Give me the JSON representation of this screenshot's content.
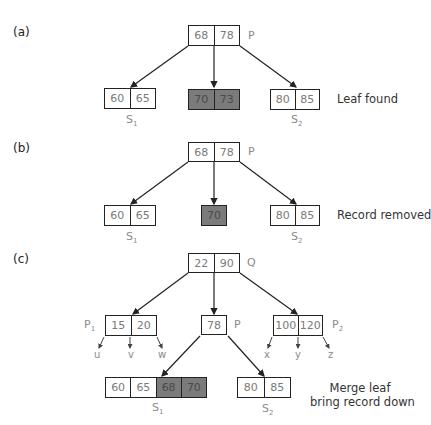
{
  "panels": [
    {
      "label": "(a)",
      "caption": "Leaf found",
      "parent": {
        "keys": [
          "68",
          "78"
        ],
        "name": "P"
      },
      "children": [
        {
          "keys": [
            "60",
            "65"
          ],
          "name": "S",
          "sub": "1",
          "highlight": [
            false,
            false
          ]
        },
        {
          "keys": [
            "70",
            "73"
          ],
          "name": "",
          "sub": "",
          "highlight": [
            true,
            true
          ]
        },
        {
          "keys": [
            "80",
            "85"
          ],
          "name": "S",
          "sub": "2",
          "highlight": [
            false,
            false
          ]
        }
      ]
    },
    {
      "label": "(b)",
      "caption": "Record removed",
      "parent": {
        "keys": [
          "68",
          "78"
        ],
        "name": "P"
      },
      "children": [
        {
          "keys": [
            "60",
            "65"
          ],
          "name": "S",
          "sub": "1",
          "highlight": [
            false,
            false
          ]
        },
        {
          "keys": [
            "70"
          ],
          "name": "",
          "sub": "",
          "highlight": [
            true
          ]
        },
        {
          "keys": [
            "80",
            "85"
          ],
          "name": "S",
          "sub": "2",
          "highlight": [
            false,
            false
          ]
        }
      ]
    },
    {
      "label": "(c)",
      "caption_lines": [
        "Merge leaf",
        "bring record down"
      ],
      "root": {
        "keys": [
          "22",
          "90"
        ],
        "name": "Q"
      },
      "internal": [
        {
          "keys": [
            "15",
            "20"
          ],
          "name": "P",
          "sub": "1",
          "pointers": [
            "u",
            "v",
            "w"
          ]
        },
        {
          "keys": [
            "78"
          ],
          "name": "P"
        },
        {
          "keys": [
            "100",
            "120"
          ],
          "name": "P",
          "sub": "2",
          "pointers": [
            "x",
            "y",
            "z"
          ]
        }
      ],
      "leaves": [
        {
          "keys": [
            "60",
            "65",
            "68",
            "70"
          ],
          "name": "S",
          "sub": "1",
          "highlight": [
            false,
            false,
            true,
            true
          ]
        },
        {
          "keys": [
            "80",
            "85"
          ],
          "name": "S",
          "sub": "2",
          "highlight": [
            false,
            false
          ]
        }
      ]
    }
  ],
  "colors": {
    "line": "#222222",
    "highlight_fill": "#7b7b7b",
    "key_text": "#7a7a7a"
  }
}
